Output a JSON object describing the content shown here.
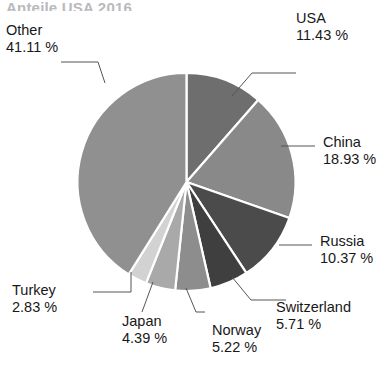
{
  "title": {
    "text": "Anteile USA 2016",
    "cropped": true
  },
  "chart_data": {
    "type": "pie",
    "title": "Anteile USA 2016",
    "unit": "%",
    "start_angle_deg": 0,
    "direction": "clockwise",
    "legend": "callout-labels",
    "grid": false,
    "categories": [
      "USA",
      "China",
      "Russia",
      "Switzerland",
      "Norway",
      "Japan",
      "Turkey",
      "Other"
    ],
    "values": [
      11.43,
      18.93,
      10.37,
      5.71,
      5.22,
      4.39,
      2.83,
      41.11
    ],
    "value_labels": [
      "11.43 %",
      "18.93 %",
      "10.37 %",
      "5.71 %",
      "5.22 %",
      "4.39 %",
      "2.83 %",
      "41.11 %"
    ],
    "colors": [
      "#6e6e6e",
      "#898989",
      "#4b4b4b",
      "#3f3f3f",
      "#8d8d8d",
      "#a9a9a9",
      "#d2d2d2",
      "#909090"
    ],
    "slice_separator_color": "#ffffff"
  },
  "slices": [
    {
      "label": "USA",
      "pct_label": "11.43 %",
      "value": 11.43,
      "color": "#6e6e6e"
    },
    {
      "label": "China",
      "pct_label": "18.93 %",
      "value": 18.93,
      "color": "#898989"
    },
    {
      "label": "Russia",
      "pct_label": "10.37 %",
      "value": 10.37,
      "color": "#4b4b4b"
    },
    {
      "label": "Switzerland",
      "pct_label": "5.71 %",
      "value": 5.71,
      "color": "#3f3f3f"
    },
    {
      "label": "Norway",
      "pct_label": "5.22 %",
      "value": 5.22,
      "color": "#8d8d8d"
    },
    {
      "label": "Japan",
      "pct_label": "4.39 %",
      "value": 4.39,
      "color": "#a9a9a9"
    },
    {
      "label": "Turkey",
      "pct_label": "2.83 %",
      "value": 2.83,
      "color": "#d2d2d2"
    },
    {
      "label": "Other",
      "pct_label": "41.11 %",
      "value": 41.11,
      "color": "#909090"
    }
  ],
  "geometry": {
    "cx": 186.5,
    "cy": 182,
    "r": 109
  }
}
